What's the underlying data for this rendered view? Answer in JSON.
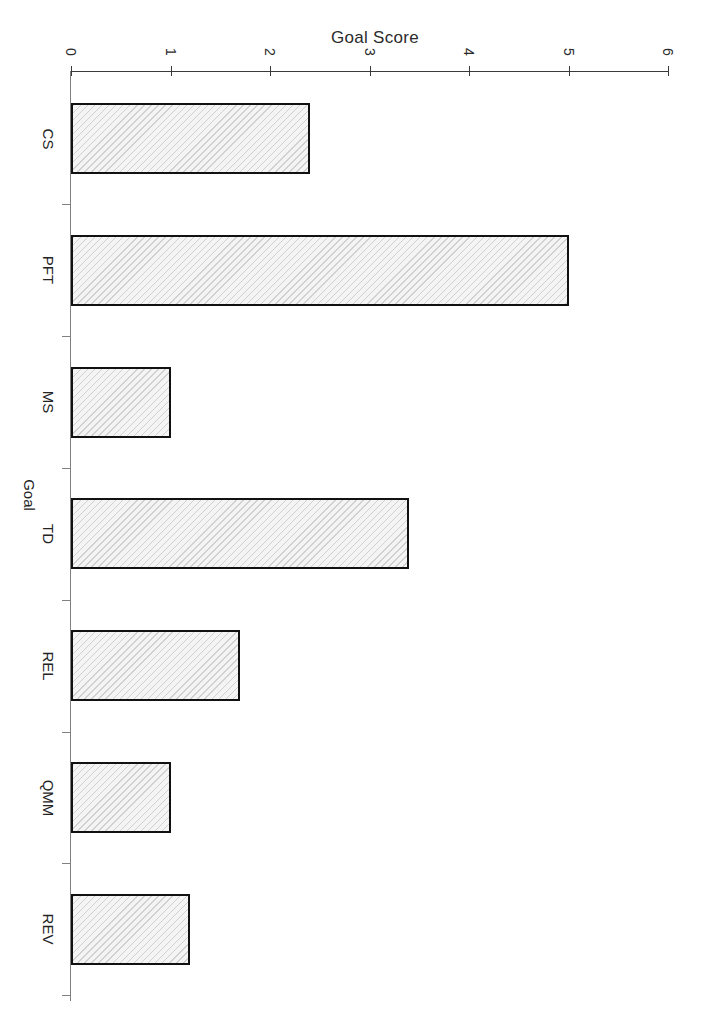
{
  "chart_data": {
    "type": "bar",
    "orientation": "horizontal",
    "title": "Goal Score",
    "xlabel": "Goal Score",
    "ylabel": "Goal",
    "categories": [
      "CS",
      "PFT",
      "MS",
      "TD",
      "REL",
      "QMM",
      "REV"
    ],
    "values": [
      2.4,
      5.0,
      1.0,
      3.4,
      1.7,
      1.0,
      1.2
    ],
    "series": [
      {
        "name": "Goal Score",
        "values": [
          2.4,
          5.0,
          1.0,
          3.4,
          1.7,
          1.0,
          1.2
        ]
      }
    ],
    "xlim": [
      0,
      6
    ],
    "ylim": null,
    "xticks": [
      0,
      1,
      2,
      3,
      4,
      5,
      6
    ],
    "xtick_labels": [
      "0",
      "1",
      "2",
      "3",
      "4",
      "5",
      "6"
    ],
    "grid": false,
    "legend": false,
    "legend_position": "none",
    "bar_fill": "#f4f4f4",
    "bar_hatch": "diagonal-light-gray",
    "bar_edge_color": "#111111",
    "axis_color": "#3a3a3a",
    "background": "#ffffff",
    "rotated_page": true
  },
  "axis": {
    "ticks": [
      {
        "label": "0",
        "value": 0
      },
      {
        "label": "1",
        "value": 1
      },
      {
        "label": "2",
        "value": 2
      },
      {
        "label": "3",
        "value": 3
      },
      {
        "label": "4",
        "value": 4
      },
      {
        "label": "5",
        "value": 5
      },
      {
        "label": "6",
        "value": 6
      }
    ],
    "category_axis_label": "Goal",
    "value_axis_label": "Goal Score"
  },
  "bars": [
    {
      "label": "CS",
      "value": 2.4
    },
    {
      "label": "PFT",
      "value": 5.0
    },
    {
      "label": "MS",
      "value": 1.0
    },
    {
      "label": "TD",
      "value": 3.4
    },
    {
      "label": "REL",
      "value": 1.7
    },
    {
      "label": "QMM",
      "value": 1.0
    },
    {
      "label": "REV",
      "value": 1.2
    }
  ]
}
